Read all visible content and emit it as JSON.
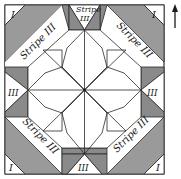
{
  "diagram": {
    "orientation_arrow": "up-arrow",
    "colors": {
      "background": "#ffffff",
      "line": "#2a2a2a",
      "dark_fill": "#8f8f8f",
      "stripe_fill": "#a3a3a3",
      "light_fill": "#ffffff"
    },
    "labels": {
      "corner_piece": "I",
      "edge_piece": "III",
      "stripe": "Stripe III",
      "stripe_top_line1": "Stripe",
      "stripe_top_line2": "III"
    },
    "corner_labels": [
      {
        "id": "top-left",
        "text": "I",
        "x": 11,
        "y": 17
      },
      {
        "id": "top-right",
        "text": "I",
        "x": 152,
        "y": 17
      },
      {
        "id": "bottom-left",
        "text": "I",
        "x": 9,
        "y": 170
      },
      {
        "id": "bottom-right",
        "text": "I",
        "x": 157,
        "y": 170
      }
    ],
    "edge_labels": [
      {
        "id": "left",
        "text": "III",
        "x": 14,
        "y": 95
      },
      {
        "id": "right",
        "text": "III",
        "x": 153,
        "y": 95
      },
      {
        "id": "bottom",
        "text": "III",
        "x": 90,
        "y": 171
      }
    ],
    "stripe_labels": [
      {
        "id": "top-left-stripe",
        "text": "Stripe III",
        "x": 40,
        "y": 44,
        "angle": -45
      },
      {
        "id": "top-right-stripe",
        "text": "Stripe III",
        "x": 130,
        "y": 48,
        "angle": 45
      },
      {
        "id": "bottom-left-stripe",
        "text": "Stripe III",
        "x": 35,
        "y": 140,
        "angle": 45
      },
      {
        "id": "bottom-right-stripe",
        "text": "Stripe III",
        "x": 130,
        "y": 140,
        "angle": -45
      }
    ],
    "top_stripe_label": {
      "line1": "Stripe",
      "line2": "III",
      "x": 89,
      "y1": 11,
      "y2": 20
    }
  }
}
